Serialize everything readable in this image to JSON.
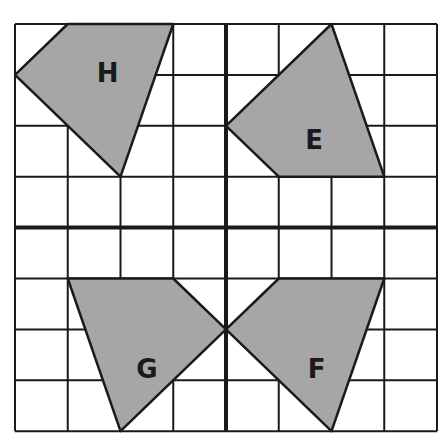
{
  "grid": {
    "origin_x": 15,
    "origin_y": 24,
    "cell_w": 52.75,
    "cell_h": 50.9,
    "cols": 8,
    "rows": 8,
    "axis_col": 4,
    "axis_row": 4,
    "line_color": "#1a1a1a",
    "shape_fill": "#a6a6a6",
    "background": "#ffffff"
  },
  "shapes": [
    {
      "label": "H",
      "points": [
        [
          1,
          0
        ],
        [
          3,
          0
        ],
        [
          2,
          3
        ],
        [
          0,
          1
        ]
      ],
      "label_pos": [
        1.55,
        0.95
      ]
    },
    {
      "label": "E",
      "points": [
        [
          6,
          0
        ],
        [
          7,
          3
        ],
        [
          5,
          3
        ],
        [
          4,
          2
        ]
      ],
      "label_pos": [
        5.5,
        2.25
      ]
    },
    {
      "label": "G",
      "points": [
        [
          1,
          5
        ],
        [
          3,
          5
        ],
        [
          4,
          6
        ],
        [
          2,
          8
        ]
      ],
      "label_pos": [
        2.3,
        6.75
      ]
    },
    {
      "label": "F",
      "points": [
        [
          5,
          5
        ],
        [
          7,
          5
        ],
        [
          6,
          8
        ],
        [
          4,
          6
        ]
      ],
      "label_pos": [
        5.55,
        6.75
      ]
    }
  ]
}
